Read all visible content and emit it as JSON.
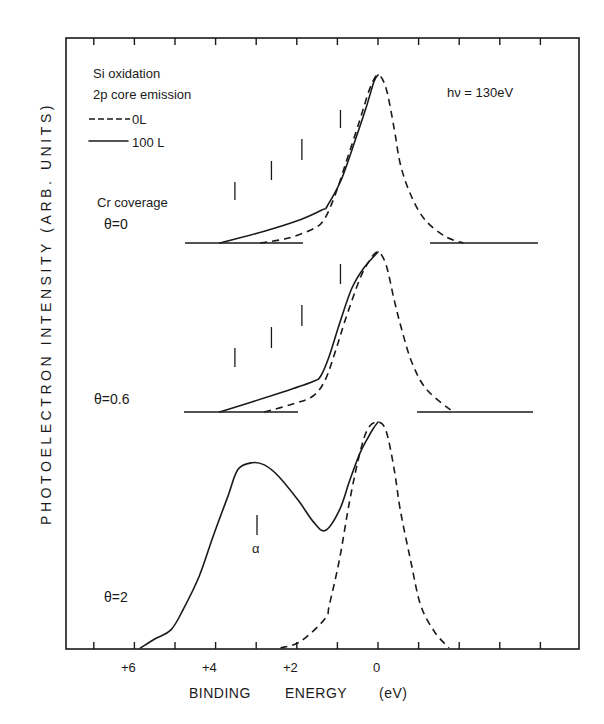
{
  "chart_data": {
    "type": "line",
    "title": "Si oxidation 2p core emission",
    "subtitle": "hν = 130eV",
    "xlabel": "BINDING ENERGY   (eV)",
    "ylabel": "PHOTOELECTRON   INTENSITY  (ARB. UNITS)",
    "x_tick_labels": [
      "+6",
      "+4",
      "+2",
      "0"
    ],
    "x_tick_values": [
      6,
      4,
      2,
      0
    ],
    "xlim": [
      7.5,
      -4.5
    ],
    "x_reversed": true,
    "grid": false,
    "legend": [
      {
        "name": "0L",
        "style": "dashed"
      },
      {
        "name": "100 L",
        "style": "solid"
      }
    ],
    "legend_title_lines": [
      "Si oxidation",
      "2p core emission"
    ],
    "photon_energy_label": "hν = 130eV",
    "coverage_title": "Cr coverage",
    "annotations": [
      {
        "text": "α",
        "x_eV": 3.0,
        "panel": "θ=2"
      }
    ],
    "panels": [
      {
        "label": "θ=0",
        "offset_marker_eV": [
          3.5,
          2.6,
          1.85,
          0.9
        ],
        "series": [
          {
            "name": "0L",
            "style": "dashed",
            "points_eV_relI": [
              [
                2.9,
                0
              ],
              [
                2.2,
                0.03
              ],
              [
                1.55,
                0.09
              ],
              [
                1.3,
                0.15
              ],
              [
                1.05,
                0.29
              ],
              [
                0.8,
                0.47
              ],
              [
                0.45,
                0.73
              ],
              [
                0.2,
                0.92
              ],
              [
                0,
                1.0
              ],
              [
                -0.2,
                0.92
              ],
              [
                -0.4,
                0.68
              ],
              [
                -0.55,
                0.47
              ],
              [
                -0.8,
                0.29
              ],
              [
                -1.15,
                0.14
              ],
              [
                -1.65,
                0.04
              ],
              [
                -2.1,
                0
              ]
            ]
          },
          {
            "name": "100 L",
            "style": "solid",
            "points_eV_relI": [
              [
                3.9,
                0
              ],
              [
                2.8,
                0.07
              ],
              [
                1.9,
                0.14
              ],
              [
                1.35,
                0.2
              ],
              [
                1.25,
                0.22
              ],
              [
                0.9,
                0.38
              ],
              [
                0.55,
                0.62
              ],
              [
                0.3,
                0.8
              ],
              [
                0.1,
                0.96
              ],
              [
                0,
                1.0
              ]
            ]
          }
        ]
      },
      {
        "label": "θ=0.6",
        "offset_marker_eV": [
          3.5,
          2.6,
          1.85,
          0.9
        ],
        "series": [
          {
            "name": "0L",
            "style": "dashed",
            "points_eV_relI": [
              [
                2.8,
                0
              ],
              [
                2.1,
                0.05
              ],
              [
                1.6,
                0.1
              ],
              [
                1.3,
                0.2
              ],
              [
                1.05,
                0.38
              ],
              [
                0.8,
                0.58
              ],
              [
                0.45,
                0.83
              ],
              [
                0.2,
                0.95
              ],
              [
                0,
                1.0
              ],
              [
                -0.2,
                0.92
              ],
              [
                -0.4,
                0.7
              ],
              [
                -0.6,
                0.5
              ],
              [
                -0.85,
                0.3
              ],
              [
                -1.2,
                0.14
              ],
              [
                -1.85,
                0
              ]
            ]
          },
          {
            "name": "100 L",
            "style": "solid",
            "points_eV_relI": [
              [
                3.9,
                0
              ],
              [
                2.4,
                0.12
              ],
              [
                1.6,
                0.19
              ],
              [
                1.4,
                0.23
              ],
              [
                1.2,
                0.35
              ],
              [
                0.95,
                0.55
              ],
              [
                0.65,
                0.77
              ],
              [
                0.35,
                0.9
              ],
              [
                0,
                1.0
              ]
            ]
          }
        ]
      },
      {
        "label": "θ=2",
        "series": [
          {
            "name": "0L",
            "style": "dashed",
            "points_eV_relI": [
              [
                2.4,
                0
              ],
              [
                1.9,
                0.03
              ],
              [
                1.3,
                0.13
              ],
              [
                1.2,
                0.19
              ],
              [
                0.95,
                0.39
              ],
              [
                0.7,
                0.65
              ],
              [
                0.45,
                0.86
              ],
              [
                0.25,
                0.97
              ],
              [
                0,
                1.0
              ],
              [
                -0.2,
                0.96
              ],
              [
                -0.4,
                0.79
              ],
              [
                -0.55,
                0.61
              ],
              [
                -0.8,
                0.39
              ],
              [
                -1.05,
                0.19
              ],
              [
                -1.4,
                0.07
              ],
              [
                -1.75,
                0
              ]
            ]
          },
          {
            "name": "100 L",
            "style": "solid",
            "points_eV_relI": [
              [
                5.85,
                0
              ],
              [
                5.5,
                0.04
              ],
              [
                5.1,
                0.08
              ],
              [
                4.8,
                0.17
              ],
              [
                4.4,
                0.32
              ],
              [
                4.05,
                0.5
              ],
              [
                3.7,
                0.67
              ],
              [
                3.45,
                0.79
              ],
              [
                3.1,
                0.82
              ],
              [
                2.8,
                0.81
              ],
              [
                2.45,
                0.76
              ],
              [
                1.95,
                0.65
              ],
              [
                1.6,
                0.56
              ],
              [
                1.3,
                0.52
              ],
              [
                0.95,
                0.61
              ],
              [
                0.7,
                0.74
              ],
              [
                0.45,
                0.86
              ],
              [
                0.25,
                0.93
              ],
              [
                0.12,
                0.97
              ],
              [
                0,
                1.0
              ]
            ]
          }
        ]
      }
    ]
  },
  "figure": {
    "legend_title_1": "Si oxidation",
    "legend_title_2": "2p core emission",
    "legend_dashed": "0L",
    "legend_solid": "100 L",
    "photon_energy": "hν = 130eV",
    "coverage_title": "Cr coverage",
    "panel_labels": [
      "θ=0",
      "θ=0.6",
      "θ=2"
    ],
    "alpha_label": "α",
    "x_ticks": [
      "+6",
      "+4",
      "+2",
      "0"
    ],
    "xlabel_parts": [
      "BINDING",
      "ENERGY",
      "(eV)"
    ],
    "ylabel": "PHOTOELECTRON   INTENSITY  (ARB. UNITS)"
  }
}
